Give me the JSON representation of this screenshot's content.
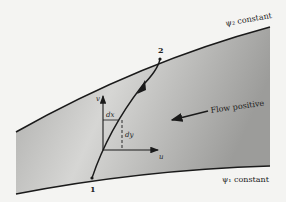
{
  "diagram": {
    "labels": {
      "psi2": "ψ₂ constant",
      "psi1": "ψ₁ constant",
      "point1": "1",
      "point2": "2",
      "flow": "Flow positive",
      "v_axis": "v",
      "u_axis": "u",
      "dx": "dx",
      "dy": "dy"
    },
    "colors": {
      "background": "#f4f4f2",
      "shade_dark": "#9a9a98",
      "shade_light": "#d8d8d6",
      "line": "#1a1a1a"
    }
  }
}
